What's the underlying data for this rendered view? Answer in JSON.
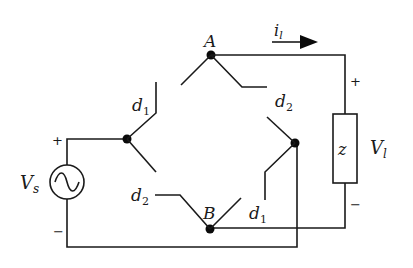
{
  "diagram": {
    "type": "circuit",
    "nodes": {
      "A": "A",
      "B": "B"
    },
    "labels": {
      "current": "i",
      "current_sub": "l",
      "load_voltage": "V",
      "load_voltage_sub": "l",
      "source_voltage": "V",
      "source_voltage_sub": "s",
      "impedance": "z",
      "d1_top": "d",
      "d1_top_sub": "1",
      "d2_top": "d",
      "d2_top_sub": "2",
      "d2_bottom": "d",
      "d2_bottom_sub": "2",
      "d1_bottom": "d",
      "d1_bottom_sub": "1"
    },
    "polarity": {
      "source_plus": "+",
      "source_minus": "−",
      "load_plus": "+",
      "load_minus": "−"
    },
    "colors": {
      "line": "#1a1a1a",
      "background": "#ffffff"
    }
  }
}
